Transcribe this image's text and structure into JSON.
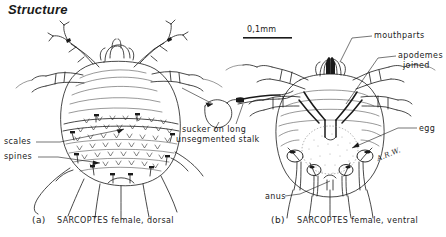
{
  "title": "Structure",
  "scale_bar": {
    "label": "0,1mm"
  },
  "panel_a": {
    "tag": "(a)",
    "caption": "SARCOPTES female, dorsal",
    "labels": {
      "scales": "scales",
      "spines": "spines"
    }
  },
  "panel_b": {
    "tag": "(b)",
    "caption": "SARCOPTES female, ventral",
    "labels": {
      "mouthparts": "mouthparts",
      "apodemes": "apodemes",
      "joined": "joined",
      "egg": "egg",
      "anus": "anus"
    }
  },
  "detail_inset": {
    "line1": "sucker on long",
    "line2": "unsegmented stalk"
  },
  "signature": "A.R.W.",
  "colors": {
    "ink": "#1a1a1a",
    "background": "#ffffff",
    "hairline": "#555555"
  }
}
